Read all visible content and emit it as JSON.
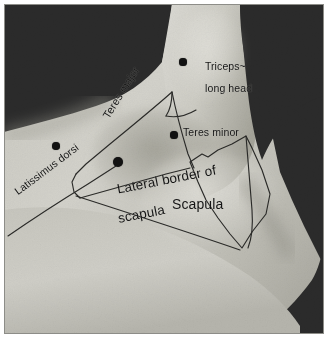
{
  "figure": {
    "kind": "surface-anatomy-photograph",
    "background_color": "#ffffff",
    "photo_border_color": "#8d8d88",
    "dark_background_color": "#2b2b2b",
    "skin_light_color": "#d5d4cd",
    "skin_mid_color": "#bcbbb3",
    "skin_shadow_color": "#9a998f",
    "overlay_line_color": "#2a2a28",
    "marker_color": "#121212"
  },
  "labels": {
    "triceps_long_head": {
      "line1": "Triceps~",
      "line2": "long head",
      "full": "Triceps~ long head",
      "rotation_deg": 0
    },
    "teres_minor": {
      "text": "Teres minor",
      "rotation_deg": 0
    },
    "teres_major": {
      "text": "Teres major",
      "rotation_deg": -58
    },
    "latissimus_dorsi": {
      "text": "Latissimus dorsi",
      "rotation_deg": -37
    },
    "lateral_border_of_scapula": {
      "line1": "Lateral border of",
      "line2": "scapula",
      "full": "Lateral border of scapula",
      "rotation_deg": -11
    },
    "scapula": {
      "text": "Scapula",
      "rotation_deg": 0
    }
  },
  "markers": [
    {
      "name": "triceps-long-head-marker",
      "x": 183,
      "y": 62,
      "r": 3.6
    },
    {
      "name": "teres-minor-marker",
      "x": 174,
      "y": 135,
      "r": 3.6
    },
    {
      "name": "teres-major-marker",
      "x": 118,
      "y": 162,
      "r": 5.2
    },
    {
      "name": "latissimus-dorsi-marker",
      "x": 56,
      "y": 146,
      "r": 3.8
    }
  ]
}
